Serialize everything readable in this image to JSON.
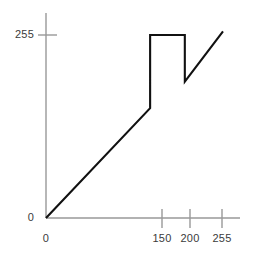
{
  "chart_data": {
    "type": "line",
    "title": "",
    "subtitle": "",
    "xlabel": "",
    "ylabel": "",
    "xlim": [
      0,
      255
    ],
    "ylim": [
      0,
      255
    ],
    "grid": false,
    "legend": null,
    "axis_color": "#999999",
    "curve_color": "#111111",
    "label_color": "#3b3b3b",
    "x_ticks": [
      {
        "value": 0,
        "label": "0"
      },
      {
        "value": 150,
        "label": "150"
      },
      {
        "value": 200,
        "label": "200"
      },
      {
        "value": 255,
        "label": "255"
      }
    ],
    "y_ticks": [
      {
        "value": 0,
        "label": "0"
      },
      {
        "value": 255,
        "label": "255"
      }
    ],
    "series": [
      {
        "name": "transformation",
        "x": [
          0,
          150,
          150,
          200,
          200,
          255
        ],
        "y": [
          0,
          153,
          255,
          255,
          190,
          260
        ]
      }
    ],
    "annotations": []
  },
  "axes": {
    "y_axis_name": "vertical-axis",
    "x_axis_name": "horizontal-axis"
  }
}
